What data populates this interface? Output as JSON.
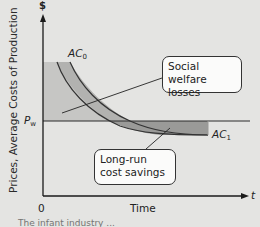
{
  "diagram": {
    "y_axis": {
      "symbol": "$",
      "label": "Prices, Average Costs of Production"
    },
    "x_axis": {
      "symbol": "t",
      "label": "Time",
      "origin": "0"
    },
    "price_line": {
      "label": "P",
      "subscript": "w"
    },
    "curves": [
      {
        "name": "AC",
        "subscript": "0"
      },
      {
        "name": "AC",
        "subscript": "1"
      }
    ],
    "callouts": {
      "welfare": {
        "line1": "Social welfare",
        "line2": "losses"
      },
      "savings": {
        "line1": "Long-run",
        "line2": "cost savings"
      }
    },
    "caption": "The infant industry ...",
    "colors": {
      "background": "#e4e4e2",
      "losses_fill": "#c6c6c4",
      "savings_fill": "#9a9a98",
      "axis": "#1a1a1a"
    }
  }
}
